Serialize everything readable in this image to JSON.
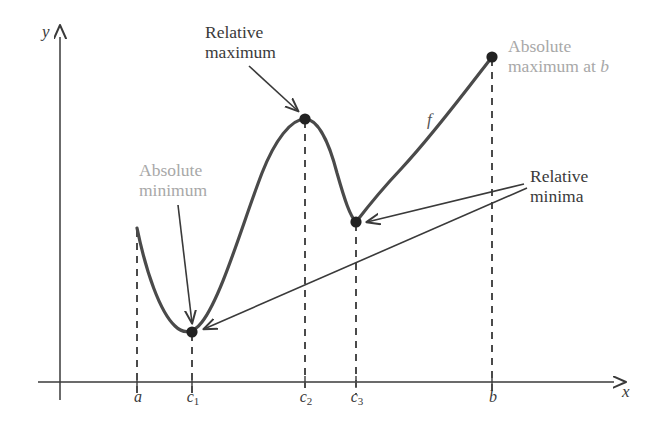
{
  "figure": {
    "kind": "calculus-extrema-diagram",
    "background": "#ffffff",
    "width": 669,
    "height": 434
  },
  "axes": {
    "y_label": "y",
    "x_label": "x",
    "color": "#3a3a3a",
    "origin_x": 60,
    "baseline_y": 382,
    "x_axis_end": 620,
    "y_axis_top": 31
  },
  "ticks": [
    {
      "label": "a",
      "sub": "",
      "x": 138
    },
    {
      "label": "c",
      "sub": "1",
      "x": 192
    },
    {
      "label": "c",
      "sub": "2",
      "x": 305
    },
    {
      "label": "c",
      "sub": "3",
      "x": 356
    },
    {
      "label": "b",
      "sub": "",
      "x": 492
    }
  ],
  "curve": {
    "name": "f",
    "color": "#4a4a4a",
    "width": 3.2,
    "points": [
      {
        "name": "left-endpoint-at-a",
        "x": 137,
        "y": 228,
        "marked": false
      },
      {
        "name": "absolute-minimum-at-c1",
        "x": 192,
        "y": 332,
        "marked": true
      },
      {
        "name": "relative-maximum-at-c2",
        "x": 305,
        "y": 119,
        "marked": true
      },
      {
        "name": "relative-minimum-at-c3",
        "x": 356,
        "y": 222,
        "marked": true
      },
      {
        "name": "absolute-maximum-at-b",
        "x": 492,
        "y": 57,
        "marked": true
      }
    ]
  },
  "annotations": {
    "relative_maximum": {
      "line1": "Relative",
      "line2": "maximum",
      "color": "#3a3a3a",
      "x": 205,
      "y": 22
    },
    "absolute_minimum": {
      "line1": "Absolute",
      "line2": "minimum",
      "color": "#a8a8a8",
      "x": 139,
      "y": 160
    },
    "absolute_maximum": {
      "line1": "Absolute",
      "line2": "maximum at ",
      "line2_italic": "b",
      "color": "#a8a8a8",
      "x": 508,
      "y": 36
    },
    "relative_minima": {
      "line1": "Relative",
      "line2": "minima",
      "color": "#3a3a3a",
      "x": 530,
      "y": 166
    },
    "curve_label": {
      "text": "f",
      "color": "#555555",
      "x": 427,
      "y": 110
    }
  },
  "dashed_guides": {
    "color": "#4a4a4a",
    "dash": "7 6",
    "lines": [
      {
        "name": "guide-at-a",
        "x": 137,
        "from_y": 228,
        "to_y": 394
      },
      {
        "name": "guide-at-c1",
        "x": 192,
        "from_y": 332,
        "to_y": 394
      },
      {
        "name": "guide-at-c2",
        "x": 305,
        "from_y": 119,
        "to_y": 394
      },
      {
        "name": "guide-at-c3",
        "x": 356,
        "from_y": 222,
        "to_y": 394
      },
      {
        "name": "guide-at-b",
        "x": 492,
        "from_y": 57,
        "to_y": 394
      }
    ]
  },
  "arrows": {
    "color": "#3a3a3a",
    "items": [
      {
        "name": "arrow-to-relative-maximum",
        "x1": 249,
        "y1": 66,
        "x2": 299,
        "y2": 112
      },
      {
        "name": "arrow-to-absolute-minimum",
        "x1": 178,
        "y1": 205,
        "x2": 192,
        "y2": 324
      },
      {
        "name": "arrow-to-relative-minimum-c3",
        "x1": 524,
        "y1": 184,
        "x2": 366,
        "y2": 223
      },
      {
        "name": "arrow-to-relative-minimum-c1",
        "x1": 527,
        "y1": 187,
        "x2": 205,
        "y2": 329
      }
    ]
  }
}
